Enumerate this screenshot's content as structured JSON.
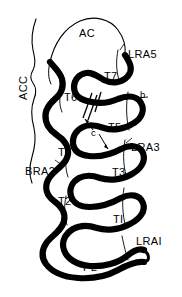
{
  "figure": {
    "kind": "anatomical-line-drawing",
    "width": 182,
    "height": 297,
    "background": "#ffffff",
    "ink": "#000000"
  },
  "labels": {
    "ac": "AC",
    "acc": "ACC",
    "lra5": "LRA5",
    "lra3": "LRA3",
    "lrai": "LRAI",
    "bra2": "BRA2",
    "pl": "PL",
    "t7": "T7",
    "t6": "T6",
    "t5": "T5",
    "t4": "T4",
    "t3": "T3",
    "t2": "T2",
    "t1": "TI",
    "b": "b",
    "c": "c"
  },
  "markers": {
    "hatch": "double-slash-cut-marks",
    "arrow_b": "leader-line",
    "arrow_c_upper": "arrow-up-left",
    "arrow_c_lower": "arrow-down-right"
  }
}
